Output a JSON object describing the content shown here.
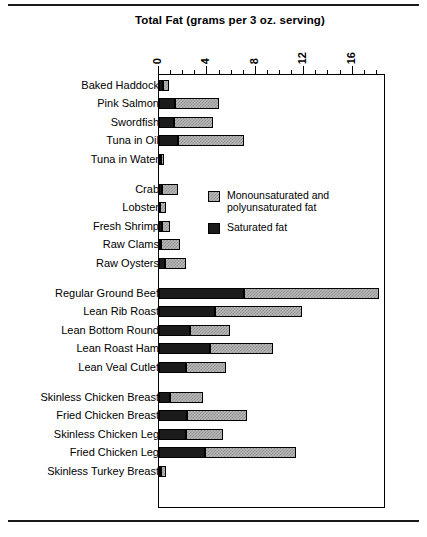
{
  "chart_data": {
    "type": "bar",
    "orientation": "horizontal",
    "stacked": true,
    "title": "Total Fat (grams per 3 oz. serving)",
    "xlabel": "",
    "ylabel": "",
    "xlim": [
      0,
      18.8
    ],
    "xticks": [
      0,
      4,
      8,
      12,
      16
    ],
    "xtick_labels": [
      "0",
      "4",
      "8",
      "12",
      "16"
    ],
    "minor_tick_interval": 1,
    "grid": false,
    "legend_position": "inside-upper-right",
    "series": [
      {
        "name": "Saturated fat",
        "color": "#1b1b1b",
        "values": [
          0.3,
          1.3,
          1.2,
          1.6,
          0.15,
          0.25,
          0.1,
          0.25,
          0.2,
          0.5,
          7.0,
          4.6,
          2.6,
          4.2,
          2.2,
          0.9,
          2.3,
          2.2,
          3.8,
          0.2
        ]
      },
      {
        "name": "Monounsaturated and polyunsaturated fat",
        "color": "#b9b9b9",
        "values": [
          0.5,
          3.7,
          3.3,
          5.4,
          0.25,
          1.35,
          0.5,
          0.65,
          1.5,
          1.7,
          11.2,
          7.2,
          3.3,
          5.2,
          3.3,
          2.7,
          5.0,
          3.1,
          7.5,
          0.4
        ]
      }
    ],
    "categories": [
      "Baked Haddock",
      "Pink Salmon",
      "Swordfish",
      "Tuna in Oil",
      "Tuna in Water",
      "Crab",
      "Lobster",
      "Fresh Shrimp",
      "Raw Clams",
      "Raw Oysters",
      "Regular Ground Beef",
      "Lean Rib Roast",
      "Lean Bottom Round",
      "Lean Roast Ham",
      "Lean Veal Cutlet",
      "Skinless Chicken Breast",
      "Fried Chicken Breast",
      "Skinless Chicken Leg",
      "Fried Chicken Leg",
      "Skinless Turkey Breast"
    ],
    "totals": [
      0.8,
      5.0,
      4.5,
      7.0,
      0.4,
      1.6,
      0.6,
      0.9,
      1.7,
      2.2,
      18.2,
      11.8,
      5.9,
      9.4,
      5.5,
      3.6,
      7.3,
      5.3,
      11.3,
      0.6
    ],
    "group_breaks_after": [
      "Tuna in Water",
      "Raw Oysters",
      "Lean Veal Cutlet"
    ]
  },
  "title": "Total Fat (grams per 3 oz. serving)",
  "axis": {
    "ticks": [
      {
        "value": 0,
        "label": "0"
      },
      {
        "value": 4,
        "label": "4"
      },
      {
        "value": 8,
        "label": "8"
      },
      {
        "value": 12,
        "label": "12"
      },
      {
        "value": 16,
        "label": "16"
      }
    ]
  },
  "legend": {
    "items": [
      {
        "label": "Monounsaturated and polyunsaturated fat",
        "swatch": "pattern",
        "color": "#b9b9b9"
      },
      {
        "label": "Saturated fat",
        "swatch": "solid",
        "color": "#1b1b1b"
      }
    ]
  },
  "rows": [
    {
      "label": "Baked Haddock",
      "sat": 0.3,
      "uns": 0.5,
      "total": 0.8,
      "gap_before": false
    },
    {
      "label": "Pink Salmon",
      "sat": 1.3,
      "uns": 3.7,
      "total": 5.0,
      "gap_before": false
    },
    {
      "label": "Swordfish",
      "sat": 1.2,
      "uns": 3.3,
      "total": 4.5,
      "gap_before": false
    },
    {
      "label": "Tuna in Oil",
      "sat": 1.6,
      "uns": 5.4,
      "total": 7.0,
      "gap_before": false
    },
    {
      "label": "Tuna in Water",
      "sat": 0.15,
      "uns": 0.25,
      "total": 0.4,
      "gap_before": false
    },
    {
      "label": "Crab",
      "sat": 0.25,
      "uns": 1.35,
      "total": 1.6,
      "gap_before": true
    },
    {
      "label": "Lobster",
      "sat": 0.1,
      "uns": 0.5,
      "total": 0.6,
      "gap_before": false
    },
    {
      "label": "Fresh Shrimp",
      "sat": 0.25,
      "uns": 0.65,
      "total": 0.9,
      "gap_before": false
    },
    {
      "label": "Raw Clams",
      "sat": 0.2,
      "uns": 1.5,
      "total": 1.7,
      "gap_before": false
    },
    {
      "label": "Raw Oysters",
      "sat": 0.5,
      "uns": 1.7,
      "total": 2.2,
      "gap_before": false
    },
    {
      "label": "Regular Ground Beef",
      "sat": 7.0,
      "uns": 11.2,
      "total": 18.2,
      "gap_before": true
    },
    {
      "label": "Lean Rib Roast",
      "sat": 4.6,
      "uns": 7.2,
      "total": 11.8,
      "gap_before": false
    },
    {
      "label": "Lean Bottom Round",
      "sat": 2.6,
      "uns": 3.3,
      "total": 5.9,
      "gap_before": false
    },
    {
      "label": "Lean Roast Ham",
      "sat": 4.2,
      "uns": 5.2,
      "total": 9.4,
      "gap_before": false
    },
    {
      "label": "Lean Veal Cutlet",
      "sat": 2.2,
      "uns": 3.3,
      "total": 5.5,
      "gap_before": false
    },
    {
      "label": "Skinless Chicken Breast",
      "sat": 0.9,
      "uns": 2.7,
      "total": 3.6,
      "gap_before": true
    },
    {
      "label": "Fried Chicken Breast",
      "sat": 2.3,
      "uns": 5.0,
      "total": 7.3,
      "gap_before": false
    },
    {
      "label": "Skinless Chicken Leg",
      "sat": 2.2,
      "uns": 3.1,
      "total": 5.3,
      "gap_before": false
    },
    {
      "label": "Fried Chicken Leg",
      "sat": 3.8,
      "uns": 7.5,
      "total": 11.3,
      "gap_before": false
    },
    {
      "label": "Skinless Turkey Breast",
      "sat": 0.2,
      "uns": 0.4,
      "total": 0.6,
      "gap_before": false
    }
  ]
}
